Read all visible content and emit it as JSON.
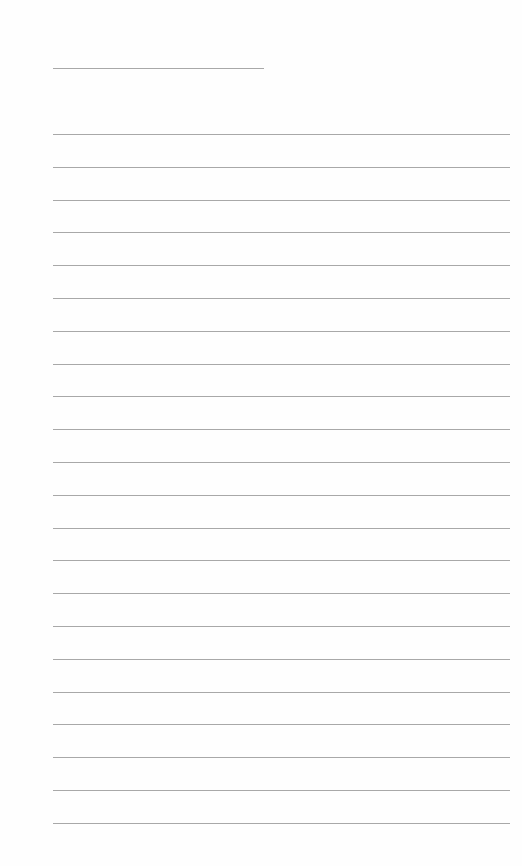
{
  "page": {
    "type": "lined-writing-sheet",
    "title_line": {
      "text": ""
    },
    "ruled_lines": [
      {
        "text": ""
      },
      {
        "text": ""
      },
      {
        "text": ""
      },
      {
        "text": ""
      },
      {
        "text": ""
      },
      {
        "text": ""
      },
      {
        "text": ""
      },
      {
        "text": ""
      },
      {
        "text": ""
      },
      {
        "text": ""
      },
      {
        "text": ""
      },
      {
        "text": ""
      },
      {
        "text": ""
      },
      {
        "text": ""
      },
      {
        "text": ""
      },
      {
        "text": ""
      },
      {
        "text": ""
      },
      {
        "text": ""
      },
      {
        "text": ""
      },
      {
        "text": ""
      },
      {
        "text": ""
      },
      {
        "text": ""
      }
    ],
    "line_color": "#a8a8a8",
    "background_color": "#ffffff"
  }
}
